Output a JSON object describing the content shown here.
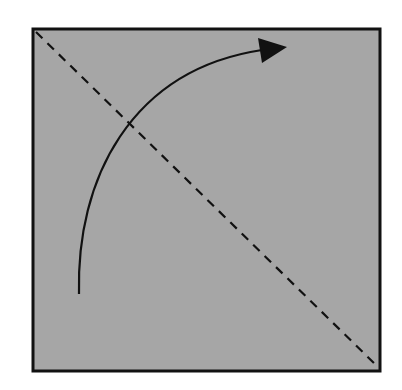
{
  "diagram": {
    "colors": {
      "background": "#ffffff",
      "square_fill": "#a6a6a6",
      "stroke": "#111111"
    },
    "square": {
      "x": 33,
      "y": 29,
      "width": 347,
      "height": 342,
      "stroke_width": 3
    },
    "diagonal": {
      "x1": 36,
      "y1": 32,
      "x2": 377,
      "y2": 366,
      "dash": "9 7",
      "stroke_width": 2.2
    },
    "arrow": {
      "path": "M 79 294 C 76 180, 130 70, 262 50",
      "stroke_width": 2.2,
      "head": "258,38 287,47 262,63"
    }
  }
}
